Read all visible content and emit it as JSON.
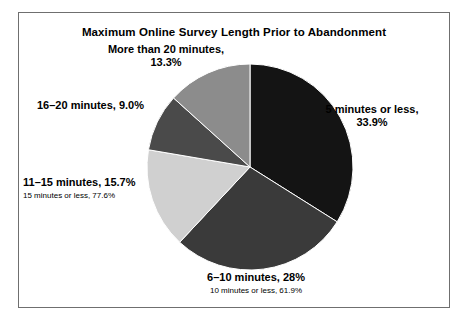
{
  "chart_data": {
    "type": "pie",
    "title": "Maximum Online Survey Length Prior to Abandonment",
    "xlabel": "",
    "ylabel": "",
    "legend_position": "none",
    "grid": false,
    "start_angle_deg": 0,
    "direction": "clockwise",
    "categories": [
      "5 minutes or less",
      "6–10 minutes",
      "11–15 minutes",
      "16–20 minutes",
      "More than 20 minutes"
    ],
    "values": [
      33.9,
      28.0,
      15.7,
      9.0,
      13.3
    ],
    "value_labels": [
      "33.9%",
      "28%",
      "15.7%",
      "9.0%",
      "13.3%"
    ],
    "colors": [
      "#141414",
      "#3a3a3a",
      "#d0d0d0",
      "#4a4a4a",
      "#8c8c8c"
    ],
    "annotations": [
      "15 minutes or less, 77.6%",
      "10 minutes or less, 61.9%"
    ]
  },
  "figure": {
    "title": "Maximum Online Survey Length Prior to Abandonment",
    "labels": {
      "more_than_20": {
        "line1": "More than 20 minutes,",
        "line2": "13.3%"
      },
      "sixteen_to_twenty": {
        "line1": "16–20 minutes, 9.0%"
      },
      "eleven_to_fifteen": {
        "line1": "11–15 minutes, 15.7%",
        "sub": "15 minutes or less, 77.6%"
      },
      "five_or_less": {
        "line1": "5 minutes or less,",
        "line2": "33.9%"
      },
      "six_to_ten": {
        "line1": "6–10 minutes, 28%",
        "sub": "10 minutes or less, 61.9%"
      }
    }
  }
}
